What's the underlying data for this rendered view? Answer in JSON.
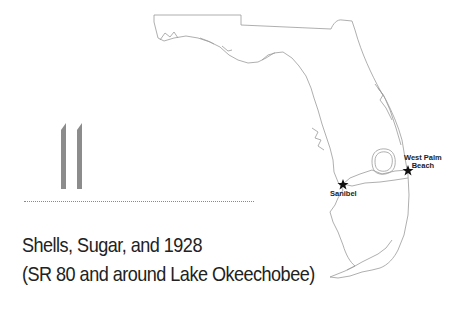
{
  "chapter": {
    "number": "11",
    "title_line1": "Shells, Sugar, and 1928",
    "title_line2": "(SR 80 and around Lake Okeechobee)"
  },
  "map": {
    "region": "Florida",
    "locations": [
      {
        "name": "Sanibel",
        "label": "Sanibel",
        "marker": "star-icon"
      },
      {
        "name": "West Palm Beach",
        "label_line1": "West Palm",
        "label_line2": "Beach",
        "marker": "star-icon"
      }
    ],
    "colors": {
      "outline": "#9a9a9a",
      "route": "#9a9a9a",
      "marker": "#111111",
      "chapter_number": "#8c8c8c"
    }
  }
}
